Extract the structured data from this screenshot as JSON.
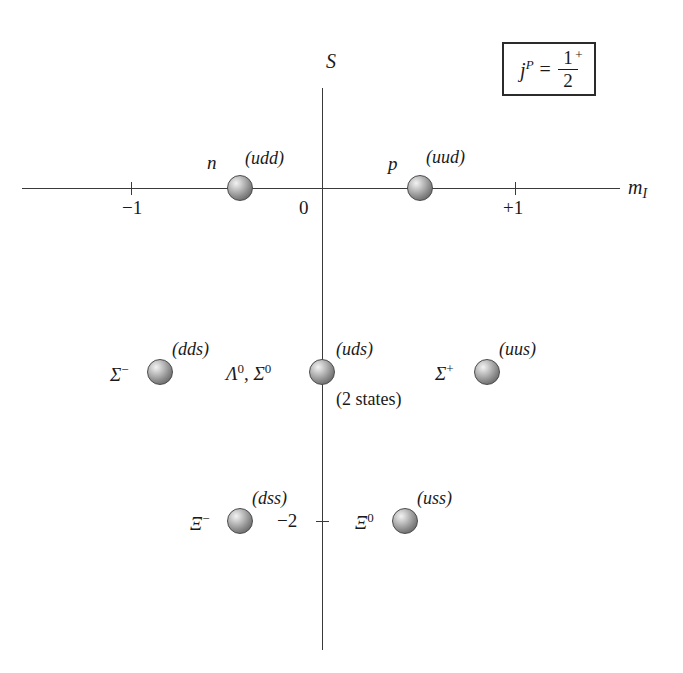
{
  "figure": {
    "axes": {
      "y_label": "S",
      "x_label_main": "m",
      "x_label_sub": "I",
      "origin_label": "0",
      "x_ticks": [
        {
          "value": -1,
          "label": "−1"
        },
        {
          "value": 1,
          "label": "+1"
        }
      ],
      "y_ticks": [
        {
          "value": -2,
          "label": "−2"
        }
      ]
    },
    "quantum_box": {
      "symbol": "j",
      "symbol_sup": "P",
      "equals": "=",
      "numerator": "1",
      "numerator_sup": "+",
      "denominator": "2"
    },
    "particles": [
      {
        "id": "neutron",
        "name": "n",
        "name_sup": "",
        "quarks": "(udd)",
        "note": "",
        "m_I": -0.5,
        "S": 0
      },
      {
        "id": "proton",
        "name": "p",
        "name_sup": "",
        "quarks": "(uud)",
        "note": "",
        "m_I": 0.5,
        "S": 0
      },
      {
        "id": "sigma-minus",
        "name": "Σ",
        "name_sup": "−",
        "quarks": "(dds)",
        "note": "",
        "m_I": -1,
        "S": -1
      },
      {
        "id": "lambda-sigma-zero",
        "name": "Λ",
        "name_sup": "0",
        "name_second": "Σ",
        "name_second_sup": "0",
        "quarks": "(uds)",
        "note": "(2 states)",
        "m_I": 0,
        "S": -1
      },
      {
        "id": "sigma-plus",
        "name": "Σ",
        "name_sup": "+",
        "quarks": "(uus)",
        "note": "",
        "m_I": 1,
        "S": -1
      },
      {
        "id": "xi-minus",
        "name": "Ξ",
        "name_sup": "−",
        "quarks": "(dss)",
        "note": "",
        "m_I": -0.5,
        "S": -2
      },
      {
        "id": "xi-zero",
        "name": "Ξ",
        "name_sup": "0",
        "quarks": "(uss)",
        "note": "",
        "m_I": 0.5,
        "S": -2
      }
    ],
    "colors": {
      "axis": "#3a3a3a",
      "text": "#1a1a1a",
      "ball_light": "#f2f2f2",
      "ball_dark": "#565656",
      "box_border": "#2b2b2b",
      "background": "#ffffff"
    }
  }
}
